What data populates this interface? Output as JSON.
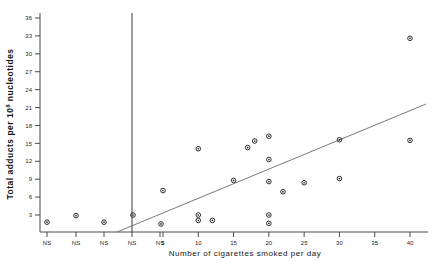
{
  "chart_data": {
    "type": "scatter",
    "title": "",
    "xlabel": "Number of cigarettes smoked per day",
    "ylabel": "Total adducts per 10⁸ nucleotides",
    "ylabel_main": "Total adducts per 10",
    "ylabel_sup": "8",
    "ylabel_tail": " nucleotides",
    "xlim": [
      0,
      44
    ],
    "ylim": [
      0,
      37.5
    ],
    "grid": false,
    "legend": null,
    "y_ticks": [
      3,
      6,
      9,
      12,
      15,
      18,
      21,
      24,
      27,
      30,
      33,
      36
    ],
    "x_ticks_categorical": [
      "NS",
      "NS",
      "NS",
      "NS",
      "NS"
    ],
    "x_ticks_numeric": [
      5,
      10,
      15,
      20,
      25,
      30,
      35,
      40
    ],
    "divider_note": "vertical line separating non-smokers from smokers",
    "series": [
      {
        "name": "Non-smokers",
        "marker": "open-circle",
        "points": [
          {
            "label": "NS",
            "slot": 0,
            "y": 1.8
          },
          {
            "label": "NS",
            "slot": 1,
            "y": 2.9
          },
          {
            "label": "NS",
            "slot": 2,
            "y": 1.8
          },
          {
            "label": "NS",
            "slot": 3,
            "y": 3.0
          },
          {
            "label": "NS",
            "slot": 4,
            "y": 1.5
          }
        ]
      },
      {
        "name": "Smokers",
        "marker": "open-circle",
        "points": [
          {
            "x": 5,
            "y": 7.1
          },
          {
            "x": 10,
            "y": 14.1
          },
          {
            "x": 10,
            "y": 3.0
          },
          {
            "x": 10,
            "y": 2.1
          },
          {
            "x": 12,
            "y": 2.1
          },
          {
            "x": 15,
            "y": 8.8
          },
          {
            "x": 17,
            "y": 14.3
          },
          {
            "x": 18,
            "y": 15.4
          },
          {
            "x": 20,
            "y": 16.2
          },
          {
            "x": 20,
            "y": 12.3
          },
          {
            "x": 20,
            "y": 8.6
          },
          {
            "x": 20,
            "y": 3.0
          },
          {
            "x": 20,
            "y": 1.6
          },
          {
            "x": 22,
            "y": 6.9
          },
          {
            "x": 25,
            "y": 8.4
          },
          {
            "x": 30,
            "y": 15.6
          },
          {
            "x": 30,
            "y": 9.1
          },
          {
            "x": 40,
            "y": 32.6
          },
          {
            "x": 40,
            "y": 15.5
          }
        ]
      }
    ],
    "fit_line": {
      "description": "linear regression line",
      "x_start_px": 117,
      "y_start_px": 232,
      "x_end_px": 426,
      "y_end_px": 104
    },
    "colors": {
      "marker": "#2b2b2b",
      "axis": "#4a4a4a",
      "fit_line": "#6a6a6a",
      "background": "#ffffff"
    }
  }
}
